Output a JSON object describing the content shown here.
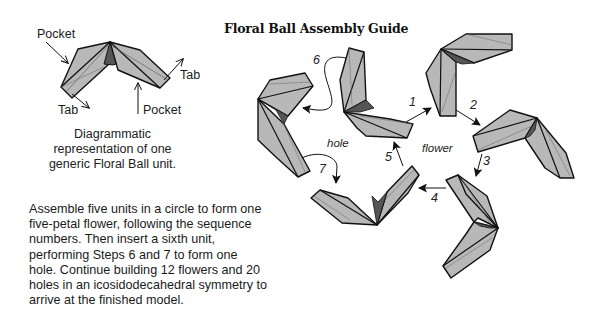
{
  "title": "Floral Ball Assembly Guide",
  "unit_diagram": {
    "labels": {
      "pocket_top_left": "Pocket",
      "tab_right": "Tab",
      "tab_bottom_left": "Tab",
      "pocket_bottom_right": "Pocket"
    },
    "caption": [
      "Diagrammatic",
      "representation of one",
      "generic Floral Ball unit."
    ]
  },
  "instructions": [
    "Assemble five units in a circle to form one",
    "five-petal flower, following the sequence",
    "numbers.  Then insert a sixth unit,",
    "performing Steps 6 and 7 to form one",
    "hole. Continue building 12 flowers and 20",
    "holes in an icosidodecahedral symmetry to",
    "arrive at the finished model."
  ],
  "assembly": {
    "regions": {
      "hole": "hole",
      "flower": "flower"
    },
    "steps": [
      "1",
      "2",
      "3",
      "4",
      "5",
      "6",
      "7"
    ]
  },
  "colors": {
    "unit_fill": "#b8b8b8",
    "unit_stroke": "#111111",
    "background": "#ffffff"
  }
}
